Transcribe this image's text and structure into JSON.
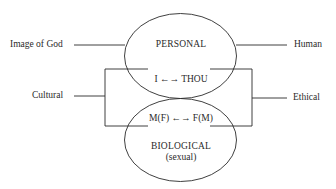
{
  "diagram": {
    "colors": {
      "stroke": "#2a2a2a",
      "text": "#2a2a2a",
      "background": "#ffffff"
    },
    "nodes": {
      "personal": {
        "label": "PERSONAL",
        "relation": "I ←→ THOU"
      },
      "biological": {
        "label": "BIOLOGICAL",
        "sublabel": "(sexual)",
        "relation": "M(F) ←→ F(M)"
      }
    },
    "side_labels": {
      "image_of_god": "Image of God",
      "human": "Human",
      "cultural": "Cultural",
      "ethical": "Ethical"
    },
    "edges": [
      {
        "from": "Image of God",
        "to": "PERSONAL"
      },
      {
        "from": "PERSONAL",
        "to": "Human"
      },
      {
        "from": "Cultural",
        "to": "I-THOU / M(F)-F(M) (bracket left)"
      },
      {
        "from": "Ethical",
        "to": "I-THOU / M(F)-F(M) (bracket right)"
      }
    ]
  }
}
